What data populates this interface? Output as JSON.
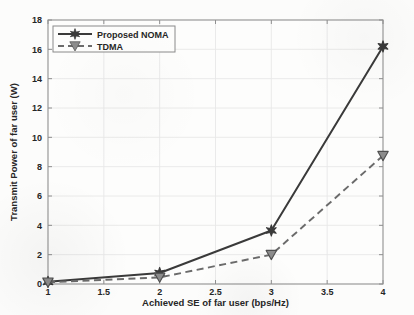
{
  "chart_data": {
    "type": "line",
    "title": "",
    "xlabel": "Achieved SE of far user (bps/Hz)",
    "ylabel": "Transmit Power of far user (W)",
    "xlim": [
      1,
      4
    ],
    "ylim": [
      0,
      18
    ],
    "xticks": [
      "1",
      "1.5",
      "2",
      "2.5",
      "3",
      "3.5",
      "4"
    ],
    "xtick_values": [
      1,
      1.5,
      2,
      2.5,
      3,
      3.5,
      4
    ],
    "yticks": [
      "0",
      "2",
      "4",
      "6",
      "8",
      "10",
      "12",
      "14",
      "16",
      "18"
    ],
    "ytick_values": [
      0,
      2,
      4,
      6,
      8,
      10,
      12,
      14,
      16,
      18
    ],
    "grid": true,
    "legend_position": "upper-left",
    "x": [
      1,
      2,
      3,
      4
    ],
    "series": [
      {
        "name": "Proposed NOMA",
        "values": [
          0.15,
          0.75,
          3.65,
          16.2
        ],
        "color": "#3a3a3a",
        "linestyle": "solid",
        "marker": "star"
      },
      {
        "name": "TDMA",
        "values": [
          0.12,
          0.45,
          2.0,
          8.75
        ],
        "color": "#6b6b6b",
        "linestyle": "dashed",
        "marker": "triangle-down"
      }
    ]
  },
  "legend": {
    "entries": [
      {
        "label": "Proposed NOMA"
      },
      {
        "label": "TDMA"
      }
    ]
  },
  "axes": {
    "x_title": "Achieved SE of far user (bps/Hz)",
    "y_title": "Transmit Power of far user (W)"
  },
  "colors": {
    "noma": "#3a3a3a",
    "tdma": "#6b6b6b",
    "axis": "#808080",
    "grid": "#e8e8e8",
    "background": "#fcfcfb"
  }
}
